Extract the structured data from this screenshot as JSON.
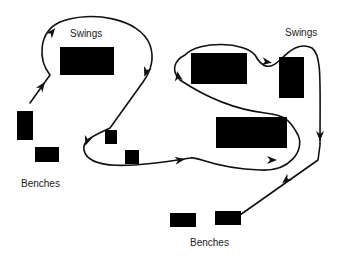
{
  "diagram": {
    "type": "playground-path-map",
    "colors": {
      "background": "#ffffff",
      "stroke": "#111111",
      "fill": "#000000",
      "text": "#222222"
    },
    "labels": [
      {
        "id": "swings-left",
        "text": "Swings",
        "x": 70,
        "y": 29
      },
      {
        "id": "swings-right",
        "text": "Swings",
        "x": 285,
        "y": 28
      },
      {
        "id": "benches-left",
        "text": "Benches",
        "x": 21,
        "y": 179
      },
      {
        "id": "benches-bottom",
        "text": "Benches",
        "x": 190,
        "y": 238
      }
    ],
    "objects": [
      {
        "id": "swing-set-left",
        "kind": "swings",
        "x": 60,
        "y": 47,
        "w": 54,
        "h": 28
      },
      {
        "id": "bench-left-1",
        "kind": "bench",
        "x": 17,
        "y": 111,
        "w": 16,
        "h": 29
      },
      {
        "id": "bench-left-2",
        "kind": "bench",
        "x": 35,
        "y": 147,
        "w": 24,
        "h": 15
      },
      {
        "id": "block-small-1",
        "kind": "block",
        "x": 105,
        "y": 130,
        "w": 12,
        "h": 14
      },
      {
        "id": "block-small-2",
        "kind": "block",
        "x": 125,
        "y": 150,
        "w": 14,
        "h": 14
      },
      {
        "id": "block-upper-middle",
        "kind": "block",
        "x": 191,
        "y": 53,
        "w": 56,
        "h": 31
      },
      {
        "id": "swing-set-right",
        "kind": "swings",
        "x": 279,
        "y": 57,
        "w": 25,
        "h": 41
      },
      {
        "id": "block-lower-middle",
        "kind": "block",
        "x": 216,
        "y": 117,
        "w": 71,
        "h": 31
      },
      {
        "id": "bench-bottom-1",
        "kind": "bench",
        "x": 170,
        "y": 213,
        "w": 26,
        "h": 14
      },
      {
        "id": "bench-bottom-2",
        "kind": "bench",
        "x": 215,
        "y": 211,
        "w": 26,
        "h": 14
      }
    ],
    "paths": [
      {
        "id": "route-path",
        "d": "M30,103 L50,75 C38,60 38,32 60,22 C90,10 140,18 150,45 C156,62 148,75 143,82 L110,128 C95,135 82,140 84,150 C88,170 130,168 190,158 C200,156 210,168 260,170 C290,172 305,150 298,135 C290,120 285,115 265,113 C240,110 210,100 180,80 C170,70 175,60 185,55 C200,40 245,42 255,55 C262,68 270,70 280,60 C290,50 300,42 312,48 C322,55 320,80 320,145 L318,160 L240,215"
      }
    ],
    "arrows": [
      {
        "id": "arrow-1",
        "x": 42,
        "y": 86,
        "angle": -55
      },
      {
        "id": "arrow-2",
        "x": 52,
        "y": 32,
        "angle": -50
      },
      {
        "id": "arrow-3",
        "x": 146,
        "y": 72,
        "angle": 110
      },
      {
        "id": "arrow-4",
        "x": 87,
        "y": 141,
        "angle": 110
      },
      {
        "id": "arrow-5",
        "x": 180,
        "y": 160,
        "angle": -8
      },
      {
        "id": "arrow-6",
        "x": 272,
        "y": 160,
        "angle": 0
      },
      {
        "id": "arrow-7",
        "x": 178,
        "y": 76,
        "angle": -100
      },
      {
        "id": "arrow-8",
        "x": 267,
        "y": 62,
        "angle": 10
      },
      {
        "id": "arrow-9",
        "x": 320,
        "y": 136,
        "angle": 90
      },
      {
        "id": "arrow-10",
        "x": 286,
        "y": 180,
        "angle": 140
      }
    ]
  }
}
